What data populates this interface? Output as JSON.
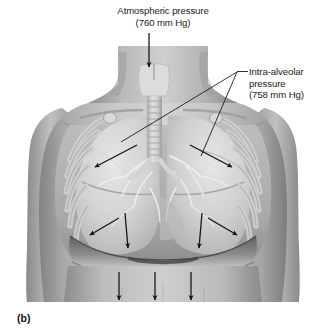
{
  "figure": {
    "panel_letter": "(b)",
    "type": "anatomical-illustration",
    "style": "grayscale halftone medical illustration"
  },
  "labels": {
    "atmospheric": {
      "line1": "Atmospheric pressure",
      "line2": "(760 mm Hg)",
      "value": "760 mm Hg"
    },
    "intraalveolar": {
      "line1": "Intra-alveolar",
      "line2": "pressure",
      "line3": "(758 mm Hg)",
      "value": "758 mm Hg"
    }
  },
  "annotations": {
    "atmospheric_arrow": {
      "name": "airflow-into-trachea",
      "direction": "down",
      "from": [
        149,
        33
      ],
      "to": [
        149,
        67
      ]
    },
    "leader_lines": [
      {
        "name": "leader-to-left-lung",
        "from": [
          237,
          74
        ],
        "to": [
          121,
          142
        ]
      },
      {
        "name": "leader-to-right-lung",
        "from": [
          237,
          74
        ],
        "to": [
          201,
          156
        ]
      }
    ],
    "expansion_arrows": [
      {
        "name": "arrow-upper-left-outward",
        "from": [
          137,
          145
        ],
        "to": [
          95,
          167
        ]
      },
      {
        "name": "arrow-upper-right-outward",
        "from": [
          190,
          145
        ],
        "to": [
          232,
          167
        ]
      },
      {
        "name": "arrow-lower-left-outward",
        "from": [
          119,
          218
        ],
        "to": [
          90,
          235
        ]
      },
      {
        "name": "arrow-lower-right-outward",
        "from": [
          208,
          218
        ],
        "to": [
          237,
          235
        ]
      },
      {
        "name": "arrow-left-diaphragm-down",
        "from": [
          125,
          213
        ],
        "to": [
          128,
          248
        ]
      },
      {
        "name": "arrow-right-diaphragm-down",
        "from": [
          202,
          213
        ],
        "to": [
          199,
          248
        ]
      }
    ],
    "abdominal_arrows": [
      {
        "name": "arrow-abdomen-down-1",
        "from": [
          119,
          272
        ],
        "to": [
          119,
          300
        ]
      },
      {
        "name": "arrow-abdomen-down-2",
        "from": [
          155,
          272
        ],
        "to": [
          155,
          300
        ]
      },
      {
        "name": "arrow-abdomen-down-3",
        "from": [
          191,
          272
        ],
        "to": [
          191,
          300
        ]
      }
    ]
  },
  "colors": {
    "background": "#ffffff",
    "text": "#1a1a1a",
    "arrow": "#111111",
    "skin_light": "#d2d2d2",
    "skin_mid": "#b4b4b4",
    "skin_dark": "#8f8f8f",
    "lung_light": "#dedede",
    "lung_mid": "#c3c3c3",
    "rib": "#c9c9c9",
    "trachea": "#d8d8d8",
    "cavity_dark": "#6e6e6e"
  }
}
